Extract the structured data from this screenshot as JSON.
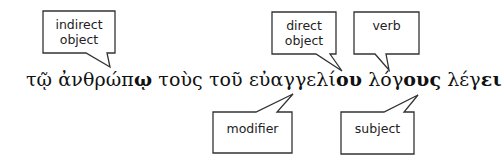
{
  "sentence": {
    "words": [
      {
        "stem": "τῷ",
        "ending": ""
      },
      {
        "stem": "ἀνθρώπ",
        "ending": "ῳ"
      },
      {
        "stem": "τοὺς",
        "ending": ""
      },
      {
        "stem": "τοῦ",
        "ending": ""
      },
      {
        "stem": "εὐαγγελί",
        "ending": "ου"
      },
      {
        "stem": "λόγ",
        "ending": "ους"
      },
      {
        "stem": "λέγ",
        "ending": "ει"
      }
    ]
  },
  "callouts": {
    "indirect_object": {
      "line1": "indirect",
      "line2": "object"
    },
    "direct_object": {
      "line1": "direct",
      "line2": "object"
    },
    "verb": {
      "line1": "verb"
    },
    "modifier": {
      "line1": "modifier"
    },
    "subject": {
      "line1": "subject"
    }
  },
  "colors": {
    "stroke": "#333333",
    "text": "#111111"
  }
}
